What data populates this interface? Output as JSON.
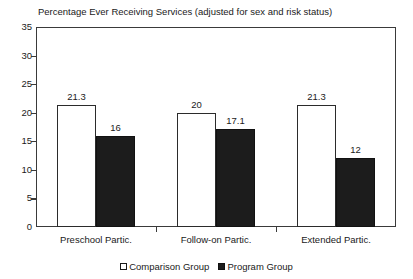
{
  "chart_data": {
    "type": "bar",
    "title": "Percentage Ever Receiving Services (adjusted for sex and risk status)",
    "xlabel": "",
    "ylabel": "",
    "ylim": [
      0,
      35
    ],
    "yticks": [
      0,
      5,
      10,
      15,
      20,
      25,
      30,
      35
    ],
    "ytick_labels": [
      "0",
      "5",
      "10",
      "15",
      "20",
      "25",
      "30",
      "35"
    ],
    "grid": false,
    "legend_position": "bottom-center",
    "categories": [
      "Preschool Partic.",
      "Follow-on Partic.",
      "Extended Partic."
    ],
    "series": [
      {
        "name": "Comparison Group",
        "color": "#ffffff",
        "edge_color": "#2b2b2b",
        "values": [
          21.3,
          20,
          21.3
        ],
        "value_labels": [
          "21.3",
          "20",
          "21.3"
        ]
      },
      {
        "name": "Program Group",
        "color": "#1c1c1c",
        "edge_color": "#111111",
        "values": [
          16,
          17.1,
          12
        ],
        "value_labels": [
          "16",
          "17.1",
          "12"
        ]
      }
    ]
  },
  "legend": {
    "entries": [
      {
        "label": "Comparison Group",
        "swatch": "white-square-icon"
      },
      {
        "label": "Program Group",
        "swatch": "black-square-icon"
      }
    ]
  }
}
